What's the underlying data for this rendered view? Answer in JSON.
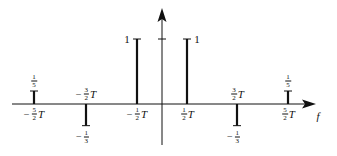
{
  "diagram": {
    "type": "line-spectrum",
    "axis": {
      "horizontal_label": "f",
      "origin_px": {
        "x": 162,
        "y": 104
      },
      "x_range_px": [
        12,
        312
      ],
      "y_range_px": [
        145,
        10
      ],
      "unit_tick_y_px": 39
    },
    "colors": {
      "line": "#111111",
      "background": "#ffffff"
    },
    "spectral_lines": [
      {
        "id": "m52",
        "x_px": 34,
        "value": 0.2,
        "value_label": {
          "sign": "",
          "num": "1",
          "den": "5"
        },
        "freq_label": {
          "sign": "−",
          "num": "5",
          "den": "2",
          "var": "T"
        }
      },
      {
        "id": "m32",
        "x_px": 86,
        "value": -0.3333,
        "value_label": {
          "sign": "−",
          "num": "1",
          "den": "3"
        },
        "freq_label": {
          "sign": "−",
          "num": "3",
          "den": "2",
          "var": "T"
        }
      },
      {
        "id": "m12",
        "x_px": 137,
        "value": 1,
        "value_label": {
          "text": "1"
        },
        "freq_label": {
          "sign": "−",
          "num": "1",
          "den": "2",
          "var": "T"
        }
      },
      {
        "id": "p12",
        "x_px": 187,
        "value": 1,
        "value_label": {
          "text": "1"
        },
        "freq_label": {
          "sign": "",
          "num": "1",
          "den": "2",
          "var": "T"
        }
      },
      {
        "id": "p32",
        "x_px": 237,
        "value": -0.3333,
        "value_label": {
          "sign": "−",
          "num": "1",
          "den": "3"
        },
        "freq_label": {
          "sign": "",
          "num": "3",
          "den": "2",
          "var": "T"
        }
      },
      {
        "id": "p52",
        "x_px": 288,
        "value": 0.2,
        "value_label": {
          "sign": "",
          "num": "1",
          "den": "5"
        },
        "freq_label": {
          "sign": "",
          "num": "5",
          "den": "2",
          "var": "T"
        }
      }
    ]
  }
}
